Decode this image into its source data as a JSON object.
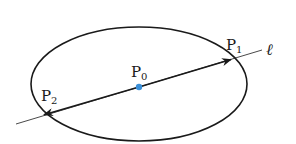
{
  "diagram": {
    "colors": {
      "stroke": "#1a1a1a",
      "center_point": "#3a8fd8",
      "background": "#ffffff"
    },
    "ellipse": {
      "cx": 139,
      "cy": 84,
      "rx": 108,
      "ry": 57
    },
    "line": {
      "label": "ℓ",
      "start": [
        16,
        124
      ],
      "end": [
        262,
        50
      ]
    },
    "points": [
      {
        "id": "P0",
        "main": "P",
        "sub": "0",
        "x": 139,
        "y": 87,
        "role": "center"
      },
      {
        "id": "P1",
        "main": "P",
        "sub": "1",
        "x": 232,
        "y": 59,
        "role": "intersection"
      },
      {
        "id": "P2",
        "main": "P",
        "sub": "2",
        "x": 43,
        "y": 115,
        "role": "intersection"
      }
    ],
    "arrows": [
      {
        "from": "P0",
        "to": "P1"
      },
      {
        "from": "P0",
        "to": "P2"
      }
    ]
  }
}
